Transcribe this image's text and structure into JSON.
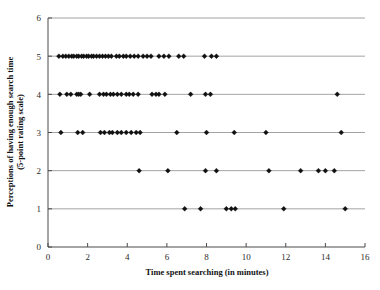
{
  "chart_data": {
    "type": "scatter",
    "title": "",
    "xlabel": "Time spent searching (in minutes)",
    "ylabel": "Perceptions of having enough search time (5-point rating scale)",
    "ylabel_line1": "Perceptions of having enough search time",
    "ylabel_line2": "(5-point rating scale)",
    "xlim": [
      0,
      16
    ],
    "ylim": [
      0,
      6
    ],
    "xticks": [
      0,
      2,
      4,
      6,
      8,
      10,
      12,
      14,
      16
    ],
    "yticks": [
      0,
      1,
      2,
      3,
      4,
      5,
      6
    ],
    "xtick_labels": [
      "0",
      "2",
      "4",
      "6",
      "8",
      "10",
      "12",
      "14",
      "16"
    ],
    "ytick_labels": [
      "0",
      "1",
      "2",
      "3",
      "4",
      "5",
      "6"
    ],
    "grid": "horizontal",
    "legend": "none",
    "marker": "diamond",
    "marker_color": "#111111",
    "series": [
      {
        "name": "Respondents",
        "points": [
          [
            0.55,
            5
          ],
          [
            0.75,
            5
          ],
          [
            0.9,
            5
          ],
          [
            1.05,
            5
          ],
          [
            1.2,
            5
          ],
          [
            1.3,
            5
          ],
          [
            1.45,
            5
          ],
          [
            1.55,
            5
          ],
          [
            1.7,
            5
          ],
          [
            1.8,
            5
          ],
          [
            1.95,
            5
          ],
          [
            2.05,
            5
          ],
          [
            2.2,
            5
          ],
          [
            2.3,
            5
          ],
          [
            2.45,
            5
          ],
          [
            2.6,
            5
          ],
          [
            2.75,
            5
          ],
          [
            2.9,
            5
          ],
          [
            3.05,
            5
          ],
          [
            3.2,
            5
          ],
          [
            3.45,
            5
          ],
          [
            3.6,
            5
          ],
          [
            3.8,
            5
          ],
          [
            3.95,
            5
          ],
          [
            4.15,
            5
          ],
          [
            4.35,
            5
          ],
          [
            4.55,
            5
          ],
          [
            4.8,
            5
          ],
          [
            5.0,
            5
          ],
          [
            5.2,
            5
          ],
          [
            5.6,
            5
          ],
          [
            5.85,
            5
          ],
          [
            6.1,
            5
          ],
          [
            6.6,
            5
          ],
          [
            6.85,
            5
          ],
          [
            7.9,
            5
          ],
          [
            8.25,
            5
          ],
          [
            8.5,
            5
          ],
          [
            0.6,
            4
          ],
          [
            0.95,
            4
          ],
          [
            1.15,
            4
          ],
          [
            1.45,
            4
          ],
          [
            1.55,
            4
          ],
          [
            1.65,
            4
          ],
          [
            2.1,
            4
          ],
          [
            2.6,
            4
          ],
          [
            2.8,
            4
          ],
          [
            2.95,
            4
          ],
          [
            3.15,
            4
          ],
          [
            3.3,
            4
          ],
          [
            3.5,
            4
          ],
          [
            3.7,
            4
          ],
          [
            3.95,
            4
          ],
          [
            4.1,
            4
          ],
          [
            4.3,
            4
          ],
          [
            4.55,
            4
          ],
          [
            5.25,
            4
          ],
          [
            5.45,
            4
          ],
          [
            5.6,
            4
          ],
          [
            5.9,
            4
          ],
          [
            7.2,
            4
          ],
          [
            7.95,
            4
          ],
          [
            8.2,
            4
          ],
          [
            14.6,
            4
          ],
          [
            0.65,
            3
          ],
          [
            1.5,
            3
          ],
          [
            1.75,
            3
          ],
          [
            2.65,
            3
          ],
          [
            2.85,
            3
          ],
          [
            3.1,
            3
          ],
          [
            3.25,
            3
          ],
          [
            3.5,
            3
          ],
          [
            3.7,
            3
          ],
          [
            3.95,
            3
          ],
          [
            4.2,
            3
          ],
          [
            4.45,
            3
          ],
          [
            4.65,
            3
          ],
          [
            6.5,
            3
          ],
          [
            8.0,
            3
          ],
          [
            9.4,
            3
          ],
          [
            11.0,
            3
          ],
          [
            14.8,
            3
          ],
          [
            4.6,
            2
          ],
          [
            6.05,
            2
          ],
          [
            7.95,
            2
          ],
          [
            8.5,
            2
          ],
          [
            11.15,
            2
          ],
          [
            12.75,
            2
          ],
          [
            13.65,
            2
          ],
          [
            14.0,
            2
          ],
          [
            14.45,
            2
          ],
          [
            6.9,
            1
          ],
          [
            7.7,
            1
          ],
          [
            9.0,
            1
          ],
          [
            9.25,
            1
          ],
          [
            9.45,
            1
          ],
          [
            11.9,
            1
          ],
          [
            15.0,
            1
          ]
        ]
      }
    ]
  },
  "caption": {
    "text": ""
  }
}
